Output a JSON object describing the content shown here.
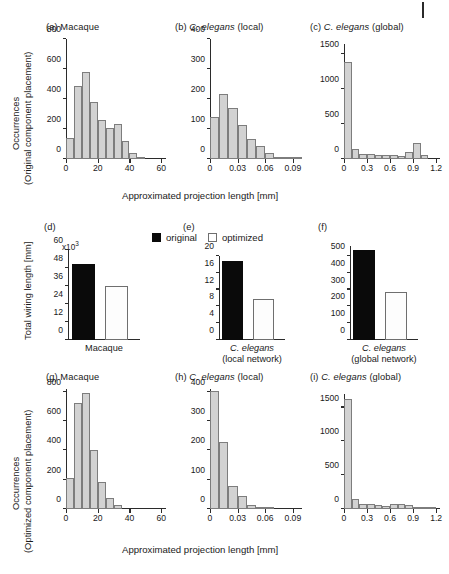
{
  "figure": {
    "corner_mark": "|",
    "axis_labels": {
      "x_common_top": "Approximated projection length [mm]",
      "x_common_bottom": "Approximated projection length [mm]",
      "y_top_line1": "Occurrences",
      "y_top_line2": "(Original component placement)",
      "y_mid": "Total wiring length [mm]",
      "y_bottom_line1": "Occurrences",
      "y_bottom_line2": "(Optimized component placement)"
    },
    "legend": {
      "original_label": "original",
      "optimized_label": "optimized",
      "original_color": "#0a0a0a",
      "optimized_color": "#ffffff"
    },
    "exponent_label": "x10",
    "exponent_sup": "3"
  },
  "chart_data": [
    {
      "panel": "a",
      "type": "bar",
      "title_tag": "(a)",
      "title_plain": "Macaque",
      "title_italic": "",
      "title_suffix": "",
      "xlabel": "Approximated projection length [mm]",
      "ylabel": "Occurrences (Original component placement)",
      "xticks": [
        0,
        20,
        40,
        60
      ],
      "xticklabels": [
        "0",
        "20",
        "40",
        "60"
      ],
      "yticks": [
        0,
        200,
        400,
        600,
        800
      ],
      "yticklabels": [
        "0",
        "200",
        "400",
        "600",
        "800"
      ],
      "xlim": [
        0,
        63
      ],
      "ylim": [
        0,
        800
      ],
      "bin_width": 5,
      "bin_starts": [
        0,
        5,
        10,
        15,
        20,
        25,
        30,
        35,
        40,
        45,
        50,
        55
      ],
      "values": [
        140,
        490,
        583,
        378,
        258,
        210,
        233,
        118,
        38,
        8,
        0,
        0
      ],
      "grid": false
    },
    {
      "panel": "b",
      "type": "bar",
      "title_tag": "(b)",
      "title_plain": "",
      "title_italic": "C. elegans",
      "title_suffix": "(local)",
      "xlabel": "Approximated projection length [mm]",
      "ylabel": "Occurrences (Original component placement)",
      "xticks": [
        0,
        0.03,
        0.06,
        0.09
      ],
      "xticklabels": [
        "0",
        "0.03",
        "0.06",
        "0.09"
      ],
      "yticks": [
        0,
        100,
        200,
        300,
        400
      ],
      "yticklabels": [
        "0",
        "100",
        "200",
        "300",
        "400"
      ],
      "xlim": [
        0,
        0.1
      ],
      "ylim": [
        0,
        400
      ],
      "bin_width": 0.01,
      "bin_starts": [
        0,
        0.01,
        0.02,
        0.03,
        0.04,
        0.05,
        0.06,
        0.07,
        0.08,
        0.09
      ],
      "values": [
        140,
        218,
        171,
        113,
        67,
        42,
        21,
        8,
        3,
        1
      ],
      "grid": false
    },
    {
      "panel": "c",
      "type": "bar",
      "title_tag": "(c)",
      "title_plain": "",
      "title_italic": "C. elegans",
      "title_suffix": "(global)",
      "xlabel": "Approximated projection length [mm]",
      "ylabel": "Occurrences (Original component placement)",
      "xticks": [
        0,
        0.3,
        0.6,
        0.9,
        1.2
      ],
      "xticklabels": [
        "0",
        "0.3",
        "0.6",
        "0.9",
        "1.2"
      ],
      "yticks": [
        0,
        500,
        1000,
        1500
      ],
      "yticklabels": [
        "0",
        "500",
        "1000",
        "1500"
      ],
      "xlim": [
        0,
        1.25
      ],
      "ylim": [
        0,
        1650
      ],
      "bin_width": 0.1,
      "bin_starts": [
        0,
        0.1,
        0.2,
        0.3,
        0.4,
        0.5,
        0.6,
        0.7,
        0.8,
        0.9,
        1.0,
        1.1
      ],
      "values": [
        1390,
        148,
        75,
        68,
        62,
        60,
        62,
        38,
        95,
        235,
        55,
        0
      ],
      "grid": false
    },
    {
      "panel": "d",
      "type": "bar",
      "title_tag": "(d)",
      "title_plain": "",
      "title_italic": "",
      "title_suffix": "",
      "category_line1": "Macaque",
      "category_line2": "",
      "ylabel": "Total wiring length [mm]",
      "y_exponent": "x10",
      "y_exponent_sup": "3",
      "yticks": [
        0,
        12,
        24,
        36,
        48,
        60
      ],
      "yticklabels": [
        "0",
        "12",
        "24",
        "36",
        "48",
        "60"
      ],
      "ylim": [
        0,
        60
      ],
      "series": [
        {
          "name": "original",
          "value": 51.0
        },
        {
          "name": "optimized",
          "value": 36.0
        }
      ],
      "grid": false
    },
    {
      "panel": "e",
      "type": "bar",
      "title_tag": "(e)",
      "title_plain": "",
      "title_italic": "",
      "title_suffix": "",
      "category_line1": "C. elegans",
      "category_line2": "(local network)",
      "ylabel": "Total wiring length [mm]",
      "yticks": [
        0,
        4,
        8,
        12,
        16,
        20
      ],
      "yticklabels": [
        "0",
        "4",
        "8",
        "12",
        "16",
        "20"
      ],
      "ylim": [
        0,
        20
      ],
      "series": [
        {
          "name": "original",
          "value": 18.8
        },
        {
          "name": "optimized",
          "value": 9.7
        }
      ],
      "grid": false
    },
    {
      "panel": "f",
      "type": "bar",
      "title_tag": "(f)",
      "title_plain": "",
      "title_italic": "",
      "title_suffix": "",
      "category_line1": "C. elegans",
      "category_line2": "(global network)",
      "ylabel": "Total wiring length [mm]",
      "yticks": [
        0,
        100,
        200,
        300,
        400,
        500
      ],
      "yticklabels": [
        "0",
        "100",
        "200",
        "300",
        "400",
        "500"
      ],
      "ylim": [
        0,
        560
      ],
      "series": [
        {
          "name": "original",
          "value": 535
        },
        {
          "name": "optimized",
          "value": 285
        }
      ],
      "grid": false
    },
    {
      "panel": "g",
      "type": "bar",
      "title_tag": "(g)",
      "title_plain": "Macaque",
      "title_italic": "",
      "title_suffix": "",
      "xlabel": "Approximated projection length [mm]",
      "ylabel": "Occurrences (Optimized component placement)",
      "xticks": [
        0,
        20,
        40,
        60
      ],
      "xticklabels": [
        "0",
        "20",
        "40",
        "60"
      ],
      "yticks": [
        0,
        200,
        400,
        600,
        800
      ],
      "yticklabels": [
        "0",
        "200",
        "400",
        "600",
        "800"
      ],
      "xlim": [
        0,
        63
      ],
      "ylim": [
        0,
        820
      ],
      "bin_width": 5,
      "bin_starts": [
        0,
        5,
        10,
        15,
        20,
        25,
        30,
        35,
        40,
        45,
        50,
        55
      ],
      "values": [
        215,
        725,
        795,
        400,
        185,
        78,
        25,
        0,
        0,
        0,
        0,
        0
      ],
      "grid": false
    },
    {
      "panel": "h",
      "type": "bar",
      "title_tag": "(h)",
      "title_plain": "",
      "title_italic": "C. elegans",
      "title_suffix": "(local)",
      "xlabel": "Approximated projection length [mm]",
      "ylabel": "Occurrences (Optimized component placement)",
      "xticks": [
        0,
        0.03,
        0.06,
        0.09
      ],
      "xticklabels": [
        "0",
        "0.03",
        "0.06",
        "0.09"
      ],
      "yticks": [
        0,
        100,
        200,
        300,
        400
      ],
      "yticklabels": [
        "0",
        "100",
        "200",
        "300",
        "400"
      ],
      "xlim": [
        0,
        0.1
      ],
      "ylim": [
        0,
        410
      ],
      "bin_width": 0.01,
      "bin_starts": [
        0,
        0.01,
        0.02,
        0.03,
        0.04,
        0.05,
        0.06,
        0.07,
        0.08,
        0.09
      ],
      "values": [
        402,
        228,
        80,
        43,
        14,
        4,
        3,
        0,
        0,
        0
      ],
      "grid": false
    },
    {
      "panel": "i",
      "type": "bar",
      "title_tag": "(i)",
      "title_plain": "",
      "title_italic": "C. elegans",
      "title_suffix": "(global)",
      "xlabel": "Approximated projection length [mm]",
      "ylabel": "Occurrences (Optimized component placement)",
      "xticks": [
        0,
        0.3,
        0.6,
        0.9,
        1.2
      ],
      "xticklabels": [
        "0",
        "0.3",
        "0.6",
        "0.9",
        "1.2"
      ],
      "yticks": [
        0,
        500,
        1000,
        1500
      ],
      "yticklabels": [
        "0",
        "500",
        "1000",
        "1500"
      ],
      "xlim": [
        0,
        1.25
      ],
      "ylim": [
        0,
        1700
      ],
      "bin_width": 0.1,
      "bin_starts": [
        0,
        0.1,
        0.2,
        0.3,
        0.4,
        0.5,
        0.6,
        0.7,
        0.8,
        0.9,
        1.0,
        1.1
      ],
      "values": [
        1625,
        150,
        78,
        72,
        55,
        50,
        68,
        72,
        58,
        35,
        12,
        5
      ],
      "grid": false
    }
  ]
}
